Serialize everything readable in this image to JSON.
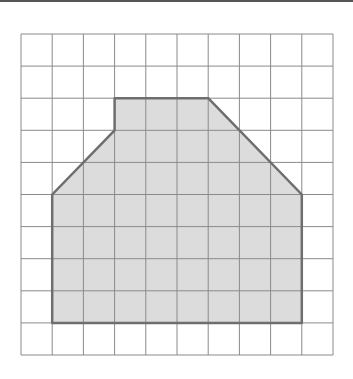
{
  "diagram": {
    "type": "grid-polygon",
    "grid": {
      "columns": 10,
      "rows": 10,
      "origin_px": [
        21,
        34
      ],
      "cell_w": 31.2,
      "cell_h": 32.1
    },
    "polygon_vertices_grid": [
      [
        3,
        2
      ],
      [
        6,
        2
      ],
      [
        9,
        5
      ],
      [
        9,
        9
      ],
      [
        1,
        9
      ],
      [
        1,
        5
      ],
      [
        3,
        3
      ]
    ],
    "colors": {
      "grid_line": "#8a8a8a",
      "shape_fill": "#dcdcdc",
      "shape_stroke": "#6e6e6e",
      "top_bar": "#555555"
    }
  }
}
